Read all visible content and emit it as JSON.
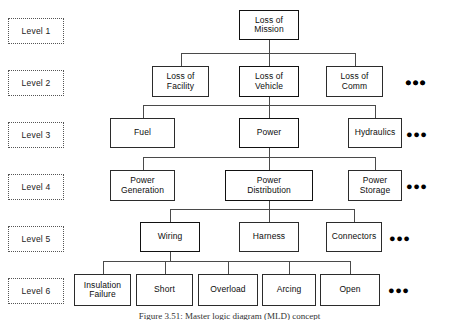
{
  "figure": {
    "caption": "Figure 3.51: Master logic diagram (MLD) concept",
    "ellipsis_glyph": "●●●",
    "colors": {
      "background": "#ffffff",
      "box_border": "#2b2b2b",
      "highlight_border": "#111111",
      "connector": "#4a4a4a",
      "level_tag_border": "#555555",
      "text": "#0d0d0d"
    }
  },
  "levels": [
    {
      "tag": "Level 1",
      "nodes": [
        {
          "lines": [
            "Loss of",
            "Mission"
          ],
          "highlighted": true
        }
      ],
      "has_ellipsis": true
    },
    {
      "tag": "Level 2",
      "nodes": [
        {
          "lines": [
            "Loss of",
            "Facility"
          ],
          "highlighted": false
        },
        {
          "lines": [
            "Loss of",
            "Vehicle"
          ],
          "highlighted": true
        },
        {
          "lines": [
            "Loss of",
            "Comm"
          ],
          "highlighted": false
        }
      ],
      "has_ellipsis": true
    },
    {
      "tag": "Level 3",
      "nodes": [
        {
          "lines": [
            "Fuel"
          ],
          "highlighted": false
        },
        {
          "lines": [
            "Power"
          ],
          "highlighted": true
        },
        {
          "lines": [
            "Hydraulics"
          ],
          "highlighted": false
        }
      ],
      "has_ellipsis": true
    },
    {
      "tag": "Level 4",
      "nodes": [
        {
          "lines": [
            "Power",
            "Generation"
          ],
          "highlighted": false
        },
        {
          "lines": [
            "Power",
            "Distribution"
          ],
          "highlighted": true
        },
        {
          "lines": [
            "Power",
            "Storage"
          ],
          "highlighted": false
        }
      ],
      "has_ellipsis": true
    },
    {
      "tag": "Level 5",
      "nodes": [
        {
          "lines": [
            "Wiring"
          ],
          "highlighted": true
        },
        {
          "lines": [
            "Harness"
          ],
          "highlighted": false
        },
        {
          "lines": [
            "Connectors"
          ],
          "highlighted": false
        }
      ],
      "has_ellipsis": true
    },
    {
      "tag": "Level 6",
      "nodes": [
        {
          "lines": [
            "Insulation",
            "Failure"
          ],
          "highlighted": false
        },
        {
          "lines": [
            "Short"
          ],
          "highlighted": false
        },
        {
          "lines": [
            "Overload"
          ],
          "highlighted": false
        },
        {
          "lines": [
            "Arcing"
          ],
          "highlighted": false
        },
        {
          "lines": [
            "Open"
          ],
          "highlighted": false
        }
      ],
      "has_ellipsis": true
    }
  ]
}
